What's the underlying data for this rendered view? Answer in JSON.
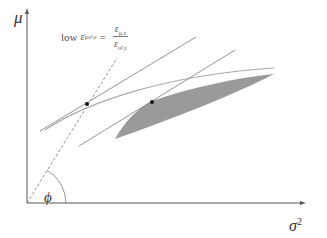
{
  "diagram": {
    "y_axis_label": "μ",
    "x_axis_label": "σ",
    "x_axis_label_sup": "2",
    "angle_label": "ϕ",
    "formula": {
      "prefix": "low",
      "lhs_symbol": "ε",
      "lhs_sub": "μσ²,ε",
      "equals": "=",
      "num_symbol": "ε",
      "num_sub": "μ,ε",
      "den_symbol": "ε",
      "den_sub": "σ²,ε"
    },
    "colors": {
      "axis": "#555555",
      "lines": "#8a8a8a",
      "shaded_region": "#9a9a9a",
      "points": "#111111"
    },
    "points": [
      {
        "x": 87,
        "y": 104
      },
      {
        "x": 152,
        "y": 102
      }
    ]
  }
}
